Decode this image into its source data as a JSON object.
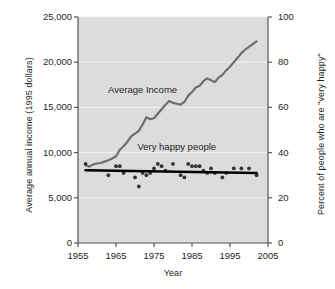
{
  "chart_data": {
    "type": "line",
    "title": "",
    "xlabel": "Year",
    "ylabel": "Average annual income (1995 dollars)",
    "ylabel_right": "Percent of people who are \"very happy\"",
    "xlim": [
      1955,
      2005
    ],
    "ylim_left": [
      0,
      25000
    ],
    "ylim_right": [
      0,
      100
    ],
    "grid": true,
    "legend": "inline-annotations",
    "xticks": [
      "1955",
      "1965",
      "1975",
      "1985",
      "1995",
      "2005"
    ],
    "xtick_values": [
      1955,
      1965,
      1975,
      1985,
      1995,
      2005
    ],
    "yticks_left": [
      "0",
      "5,000",
      "10,000",
      "15,000",
      "20,000",
      "25,000"
    ],
    "ytick_values_left": [
      0,
      5000,
      10000,
      15000,
      20000,
      25000
    ],
    "yticks_right": [
      "0",
      "20",
      "40",
      "60",
      "80",
      "100"
    ],
    "ytick_values_right": [
      0,
      20,
      40,
      60,
      80,
      100
    ],
    "annotations": [
      {
        "text": "Average Income",
        "x": 1972,
        "y": 16600
      },
      {
        "text": "Very happy people",
        "x": 1981,
        "y": 10300
      }
    ],
    "series": [
      {
        "name": "Average Income",
        "type": "line",
        "axis": "left",
        "color": "#6e6e6e",
        "x": [
          1957,
          1958,
          1959,
          1960,
          1961,
          1962,
          1963,
          1964,
          1965,
          1966,
          1967,
          1968,
          1969,
          1970,
          1971,
          1972,
          1973,
          1974,
          1975,
          1976,
          1977,
          1978,
          1979,
          1980,
          1981,
          1982,
          1983,
          1984,
          1985,
          1986,
          1987,
          1988,
          1989,
          1990,
          1991,
          1992,
          1993,
          1994,
          1995,
          1996,
          1997,
          1998,
          1999,
          2000,
          2001,
          2002
        ],
        "values": [
          8600,
          8450,
          8700,
          8800,
          8850,
          9000,
          9150,
          9350,
          9600,
          10300,
          10700,
          11200,
          11800,
          12100,
          12400,
          13100,
          13900,
          13700,
          13800,
          14300,
          14800,
          15300,
          15700,
          15500,
          15400,
          15300,
          15600,
          16300,
          16700,
          17200,
          17400,
          17900,
          18200,
          18000,
          17800,
          18300,
          18600,
          19100,
          19500,
          20000,
          20500,
          21000,
          21400,
          21700,
          22000,
          22300
        ]
      },
      {
        "name": "Very happy people",
        "type": "scatter",
        "axis": "right",
        "color": "#333333",
        "x": [
          1957,
          1963,
          1965,
          1966,
          1967,
          1970,
          1971,
          1972,
          1973,
          1974,
          1975,
          1976,
          1977,
          1978,
          1980,
          1982,
          1983,
          1984,
          1985,
          1986,
          1987,
          1988,
          1989,
          1990,
          1991,
          1993,
          1994,
          1996,
          1998,
          2000,
          2002
        ],
        "values": [
          35,
          30,
          34,
          34,
          31,
          29,
          25,
          31,
          30,
          31,
          33,
          35,
          34,
          32,
          35,
          30,
          29,
          35,
          34,
          34,
          34,
          32,
          31,
          33,
          31,
          29,
          31,
          33,
          33,
          33,
          30
        ]
      },
      {
        "name": "Very happy people trend",
        "type": "line",
        "axis": "right",
        "color": "#000000",
        "x": [
          1957,
          2002
        ],
        "values": [
          32.2,
          31.0
        ]
      }
    ]
  }
}
